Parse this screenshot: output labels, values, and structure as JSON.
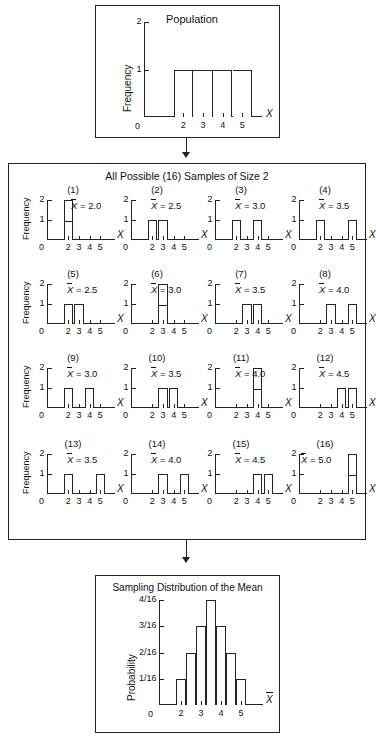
{
  "population": {
    "title": "Population",
    "ylabel": "Frequency",
    "xlabel": "X",
    "y_ticks": [
      "2",
      "1"
    ],
    "zero": "0",
    "x_ticks": [
      "2",
      "3",
      "4",
      "5"
    ]
  },
  "samples": {
    "title": "All Possible (16) Samples of Size 2",
    "ylabel": "Frequency",
    "xlabel": "X",
    "y_ticks": [
      "2",
      "1"
    ],
    "zero": "0",
    "x_ticks": [
      "2",
      "3",
      "4",
      "5"
    ],
    "items": [
      {
        "id": "(1)",
        "mean": "= 2.0",
        "mean_prefix": "X"
      },
      {
        "id": "(2)",
        "mean": "= 2.5",
        "mean_prefix": "X"
      },
      {
        "id": "(3)",
        "mean": "= 3.0",
        "mean_prefix": "X"
      },
      {
        "id": "(4)",
        "mean": "= 3.5",
        "mean_prefix": "X"
      },
      {
        "id": "(5)",
        "mean": "= 2.5",
        "mean_prefix": "X"
      },
      {
        "id": "(6)",
        "mean": "= 3.0",
        "mean_prefix": "X"
      },
      {
        "id": "(7)",
        "mean": "= 3.5",
        "mean_prefix": "X"
      },
      {
        "id": "(8)",
        "mean": "= 4.0",
        "mean_prefix": "X"
      },
      {
        "id": "(9)",
        "mean": "= 3.0",
        "mean_prefix": "X"
      },
      {
        "id": "(10)",
        "mean": "= 3.5",
        "mean_prefix": "X"
      },
      {
        "id": "(11)",
        "mean": "= 4.0",
        "mean_prefix": "X"
      },
      {
        "id": "(12)",
        "mean": "= 4.5",
        "mean_prefix": "X"
      },
      {
        "id": "(13)",
        "mean": "= 3.5",
        "mean_prefix": "X"
      },
      {
        "id": "(14)",
        "mean": "= 4.0",
        "mean_prefix": "X"
      },
      {
        "id": "(15)",
        "mean": "= 4.5",
        "mean_prefix": "X"
      },
      {
        "id": "(16)",
        "mean": "= 5.0",
        "mean_prefix": "X"
      }
    ]
  },
  "sampling": {
    "title": "Sampling Distribution of the Mean",
    "ylabel": "Probability",
    "xlabel": "X",
    "y_ticks": [
      "4/16",
      "3/16",
      "2/16",
      "1/16"
    ],
    "zero": "0",
    "x_ticks": [
      "2",
      "3",
      "4",
      "5"
    ]
  },
  "chart_data": [
    {
      "type": "bar",
      "title": "Population",
      "xlabel": "X",
      "ylabel": "Frequency",
      "categories": [
        2,
        3,
        4,
        5
      ],
      "values": [
        1,
        1,
        1,
        1
      ],
      "ylim": [
        0,
        2
      ],
      "xlim": [
        0,
        6
      ],
      "grid": false,
      "note": "contiguous bars, each frequency 1"
    },
    {
      "type": "bar",
      "title": "All Possible (16) Samples of Size 2",
      "xlabel": "X",
      "ylabel": "Frequency",
      "ylim": [
        0,
        2
      ],
      "xlim": [
        0,
        6
      ],
      "grid": false,
      "panels": [
        {
          "id": "(1)",
          "sample": [
            2,
            2
          ],
          "mean": 2.0,
          "categories": [
            2,
            3,
            4,
            5
          ],
          "values": [
            2,
            0,
            0,
            0
          ]
        },
        {
          "id": "(2)",
          "sample": [
            2,
            3
          ],
          "mean": 2.5,
          "categories": [
            2,
            3,
            4,
            5
          ],
          "values": [
            1,
            1,
            0,
            0
          ]
        },
        {
          "id": "(3)",
          "sample": [
            2,
            4
          ],
          "mean": 3.0,
          "categories": [
            2,
            3,
            4,
            5
          ],
          "values": [
            1,
            0,
            1,
            0
          ]
        },
        {
          "id": "(4)",
          "sample": [
            2,
            5
          ],
          "mean": 3.5,
          "categories": [
            2,
            3,
            4,
            5
          ],
          "values": [
            1,
            0,
            0,
            1
          ]
        },
        {
          "id": "(5)",
          "sample": [
            3,
            2
          ],
          "mean": 2.5,
          "categories": [
            2,
            3,
            4,
            5
          ],
          "values": [
            1,
            1,
            0,
            0
          ]
        },
        {
          "id": "(6)",
          "sample": [
            3,
            3
          ],
          "mean": 3.0,
          "categories": [
            2,
            3,
            4,
            5
          ],
          "values": [
            0,
            2,
            0,
            0
          ]
        },
        {
          "id": "(7)",
          "sample": [
            3,
            4
          ],
          "mean": 3.5,
          "categories": [
            2,
            3,
            4,
            5
          ],
          "values": [
            0,
            1,
            1,
            0
          ]
        },
        {
          "id": "(8)",
          "sample": [
            3,
            5
          ],
          "mean": 4.0,
          "categories": [
            2,
            3,
            4,
            5
          ],
          "values": [
            0,
            1,
            0,
            1
          ]
        },
        {
          "id": "(9)",
          "sample": [
            4,
            2
          ],
          "mean": 3.0,
          "categories": [
            2,
            3,
            4,
            5
          ],
          "values": [
            1,
            0,
            1,
            0
          ]
        },
        {
          "id": "(10)",
          "sample": [
            4,
            3
          ],
          "mean": 3.5,
          "categories": [
            2,
            3,
            4,
            5
          ],
          "values": [
            0,
            1,
            1,
            0
          ]
        },
        {
          "id": "(11)",
          "sample": [
            4,
            4
          ],
          "mean": 4.0,
          "categories": [
            2,
            3,
            4,
            5
          ],
          "values": [
            0,
            0,
            2,
            0
          ]
        },
        {
          "id": "(12)",
          "sample": [
            4,
            5
          ],
          "mean": 4.5,
          "categories": [
            2,
            3,
            4,
            5
          ],
          "values": [
            0,
            0,
            1,
            1
          ]
        },
        {
          "id": "(13)",
          "sample": [
            5,
            2
          ],
          "mean": 3.5,
          "categories": [
            2,
            3,
            4,
            5
          ],
          "values": [
            1,
            0,
            0,
            1
          ]
        },
        {
          "id": "(14)",
          "sample": [
            5,
            3
          ],
          "mean": 4.0,
          "categories": [
            2,
            3,
            4,
            5
          ],
          "values": [
            0,
            1,
            0,
            1
          ]
        },
        {
          "id": "(15)",
          "sample": [
            5,
            4
          ],
          "mean": 4.5,
          "categories": [
            2,
            3,
            4,
            5
          ],
          "values": [
            0,
            0,
            1,
            1
          ]
        },
        {
          "id": "(16)",
          "sample": [
            5,
            5
          ],
          "mean": 5.0,
          "categories": [
            2,
            3,
            4,
            5
          ],
          "values": [
            0,
            0,
            0,
            2
          ]
        }
      ]
    },
    {
      "type": "bar",
      "title": "Sampling Distribution of the Mean",
      "xlabel": "X",
      "ylabel": "Probability",
      "categories": [
        2,
        2.5,
        3,
        3.5,
        4,
        4.5,
        5
      ],
      "values": [
        0.0625,
        0.125,
        0.1875,
        0.25,
        0.1875,
        0.125,
        0.0625
      ],
      "value_labels": [
        "1/16",
        "2/16",
        "3/16",
        "4/16",
        "3/16",
        "2/16",
        "1/16"
      ],
      "ylim": [
        0,
        0.25
      ],
      "xlim": [
        0,
        6
      ],
      "grid": false
    }
  ]
}
